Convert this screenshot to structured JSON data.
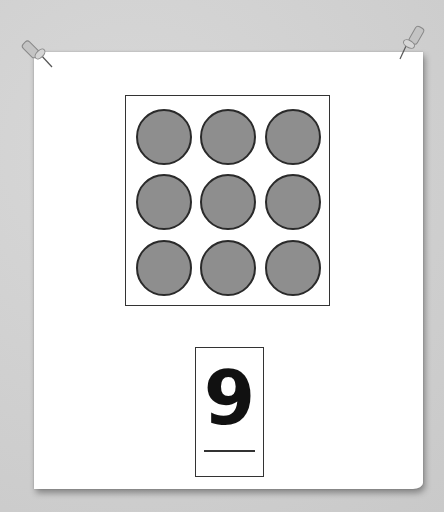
{
  "scene": {
    "type": "pinned-paper",
    "background_color": "#cfcfcf",
    "paper_color": "#ffffff"
  },
  "pins": [
    {
      "name": "top-left-pushpin",
      "color": "#b8b8b8"
    },
    {
      "name": "top-right-pushpin",
      "color": "#b8b8b8"
    }
  ],
  "dot_grid": {
    "rows": 3,
    "cols": 3,
    "count": 9,
    "dot_color": "#8e8e8e",
    "outline_color": "#2a2a2a"
  },
  "number_card": {
    "numeral": "9"
  }
}
